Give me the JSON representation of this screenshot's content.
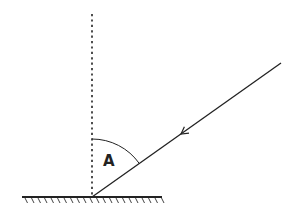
{
  "diagram": {
    "colors": {
      "background": "#ffffff",
      "stroke": "#222222"
    },
    "surface": {
      "x1": 22,
      "x2": 162,
      "y": 197,
      "hatch_spacing": 6.5,
      "hatch_length": 5
    },
    "normal": {
      "x": 92,
      "y_top": 14,
      "y_bottom": 197,
      "style": "dotted"
    },
    "incident_ray": {
      "x1": 281,
      "y1": 63,
      "x2": 92,
      "y2": 197,
      "arrow": {
        "x": 181,
        "y": 134,
        "direction": "toward-surface"
      }
    },
    "angle_arc": {
      "cx": 92,
      "cy": 197,
      "r": 58
    },
    "labels": {
      "angle": "A"
    }
  }
}
